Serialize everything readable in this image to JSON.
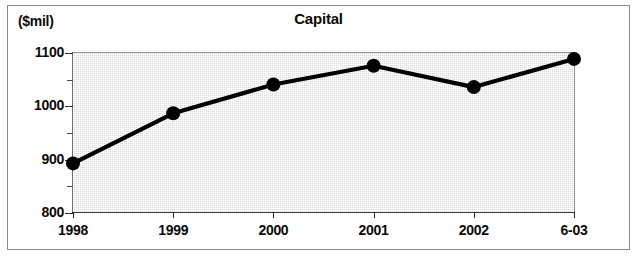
{
  "chart_data": {
    "type": "line",
    "title": "Capital",
    "xlabel": "",
    "ylabel": "($mil)",
    "ylim": [
      800,
      1100
    ],
    "yticks": [
      800,
      900,
      1000,
      1100
    ],
    "yticks_minor": [
      850,
      950,
      1050
    ],
    "ytick_labels": [
      "800",
      "900",
      "1000",
      "1100"
    ],
    "categories": [
      "1998",
      "1999",
      "2000",
      "2001",
      "2002",
      "6-03"
    ],
    "values": [
      893,
      987,
      1041,
      1076,
      1036,
      1089
    ],
    "series": [
      {
        "name": "Capital",
        "values": [
          893,
          987,
          1041,
          1076,
          1036,
          1089
        ]
      }
    ],
    "grid": false,
    "legend": "none",
    "marker": "filled-circle",
    "line_color": "#000000",
    "marker_color": "#000000",
    "plot_background": "#d8d8d8",
    "figure_background": "#ffffff",
    "frame_color": "#8a8a8a",
    "annotations": []
  },
  "figure": {
    "title": "Capital",
    "y_unit_label": "($mil)"
  }
}
